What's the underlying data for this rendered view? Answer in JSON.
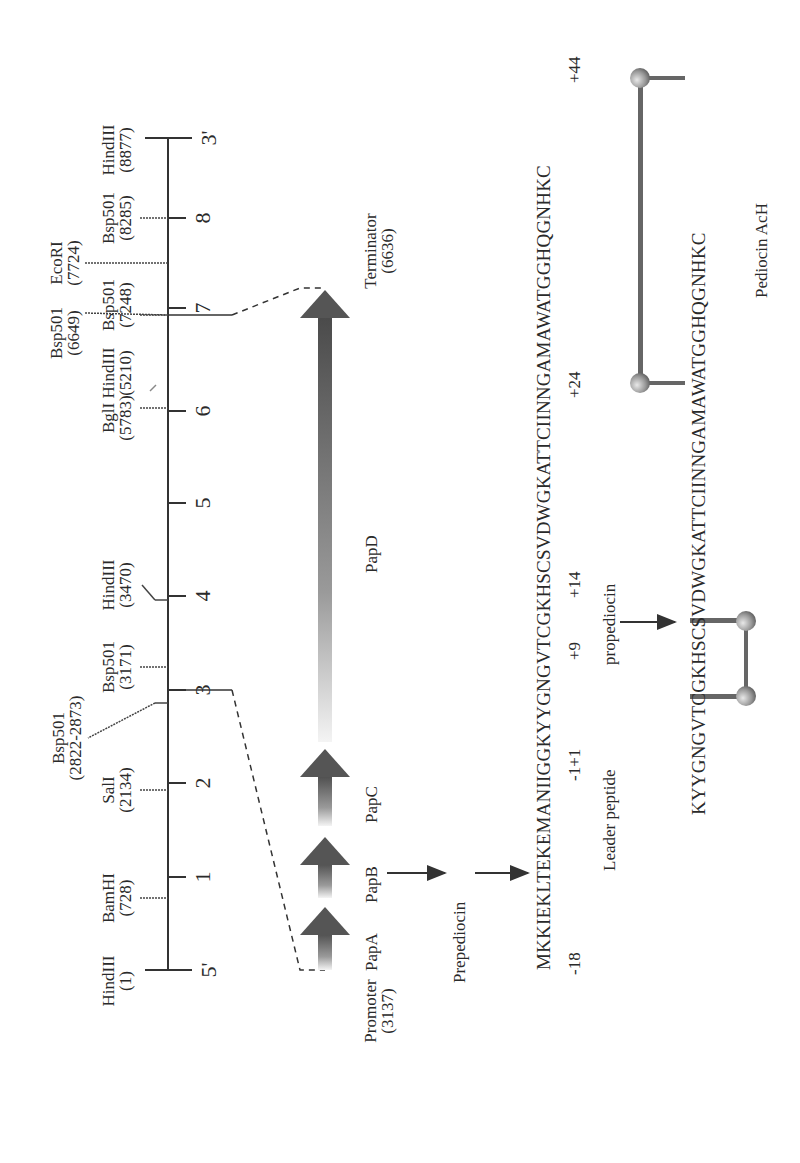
{
  "figure": {
    "orientation": "rotated 90 degrees counter-clockwise"
  },
  "map": {
    "end_5": "5'",
    "end_3": "3'",
    "scale_ticks": [
      "1",
      "2",
      "3",
      "4",
      "5",
      "6",
      "7",
      "8"
    ],
    "sites": [
      {
        "name": "HindIII",
        "pos": "(1)"
      },
      {
        "name": "BamHI",
        "pos": "(728)"
      },
      {
        "name": "SalI",
        "pos": "(2134)"
      },
      {
        "name": "Bsp501",
        "pos": "(2822-2873)"
      },
      {
        "name": "Bsp501",
        "pos": "(3171)"
      },
      {
        "name": "HindIII",
        "pos": "(3470)"
      },
      {
        "name": "BglI",
        "pos": "(5783)"
      },
      {
        "name": "HindIII",
        "pos": "(5210)"
      },
      {
        "name": "Bsp501",
        "pos": "(6649)"
      },
      {
        "name": "Bsp501",
        "pos": "(7248)"
      },
      {
        "name": "EcoRI",
        "pos": "(7724)"
      },
      {
        "name": "Bsp501",
        "pos": "(8285)"
      },
      {
        "name": "HindIII",
        "pos": "(8877)"
      }
    ]
  },
  "operon": {
    "promoter": {
      "name": "Promoter",
      "pos": "(3137)"
    },
    "terminator": {
      "name": "Terminator",
      "pos": "(6636)"
    },
    "genes": [
      "PapA",
      "PapB",
      "PapC",
      "PapD"
    ],
    "gene_colors": {
      "dark": "#505050",
      "light": "#f0f0f0"
    }
  },
  "processing": {
    "prepediocin_label": "Prepediocin",
    "leader_sequence": "MKKIEKLTEKEMANIIGG",
    "mature_sequence_part1": "KYYGNGVTCGKHSCSVDWGKATT",
    "mature_sequence_part2": "CIINNGAMAWATGGHQGNHKC",
    "positions": [
      "-18",
      "-1+1",
      "+9",
      "+14",
      "+24",
      "+44"
    ],
    "leader_label": "Leader peptide",
    "propediocin_label": "propediocin",
    "final_part1": "KYYGNGVTCGKHSCSVDWGKATT",
    "final_part2": "CIINNGAMAWATGGHQGNHKC",
    "disulfide_atom": "S",
    "product_label": "Pediocin AcH"
  }
}
